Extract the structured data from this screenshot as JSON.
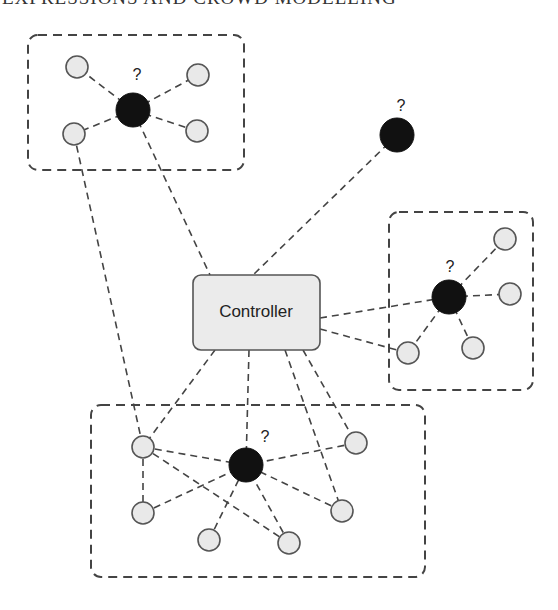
{
  "header": {
    "text": "EXPRESSIONS AND CROWD MODELLING"
  },
  "controller": {
    "label": "Controller"
  },
  "unknown_marker": "?",
  "colors": {
    "stroke": "#444444",
    "node_fill": "#e9e9e9",
    "agent_fill": "#111111",
    "controller_fill": "#ebebeb"
  },
  "groups": [
    {
      "id": "top-left",
      "box": [
        28,
        35,
        216,
        135
      ]
    },
    {
      "id": "right",
      "box": [
        389,
        212,
        144,
        178
      ]
    },
    {
      "id": "bottom",
      "box": [
        91,
        405,
        334,
        172
      ]
    }
  ],
  "agents": [
    {
      "id": "agent-top-left",
      "x": 133,
      "y": 110,
      "label": "?"
    },
    {
      "id": "agent-lone",
      "x": 397,
      "y": 135,
      "label": "?"
    },
    {
      "id": "agent-right",
      "x": 449,
      "y": 297,
      "label": "?"
    },
    {
      "id": "agent-bottom",
      "x": 246,
      "y": 465,
      "label": "?"
    }
  ],
  "nodes": [
    {
      "id": "tl1",
      "x": 77,
      "y": 67
    },
    {
      "id": "tl2",
      "x": 198,
      "y": 75
    },
    {
      "id": "tl3",
      "x": 74,
      "y": 134
    },
    {
      "id": "tl4",
      "x": 197,
      "y": 131
    },
    {
      "id": "r1",
      "x": 505,
      "y": 239
    },
    {
      "id": "r2",
      "x": 510,
      "y": 294
    },
    {
      "id": "r3",
      "x": 473,
      "y": 348
    },
    {
      "id": "r4",
      "x": 408,
      "y": 353
    },
    {
      "id": "b1",
      "x": 143,
      "y": 447
    },
    {
      "id": "b2",
      "x": 143,
      "y": 513
    },
    {
      "id": "b3",
      "x": 209,
      "y": 540
    },
    {
      "id": "b4",
      "x": 289,
      "y": 543
    },
    {
      "id": "b5",
      "x": 356,
      "y": 443
    },
    {
      "id": "b6",
      "x": 342,
      "y": 511
    }
  ]
}
